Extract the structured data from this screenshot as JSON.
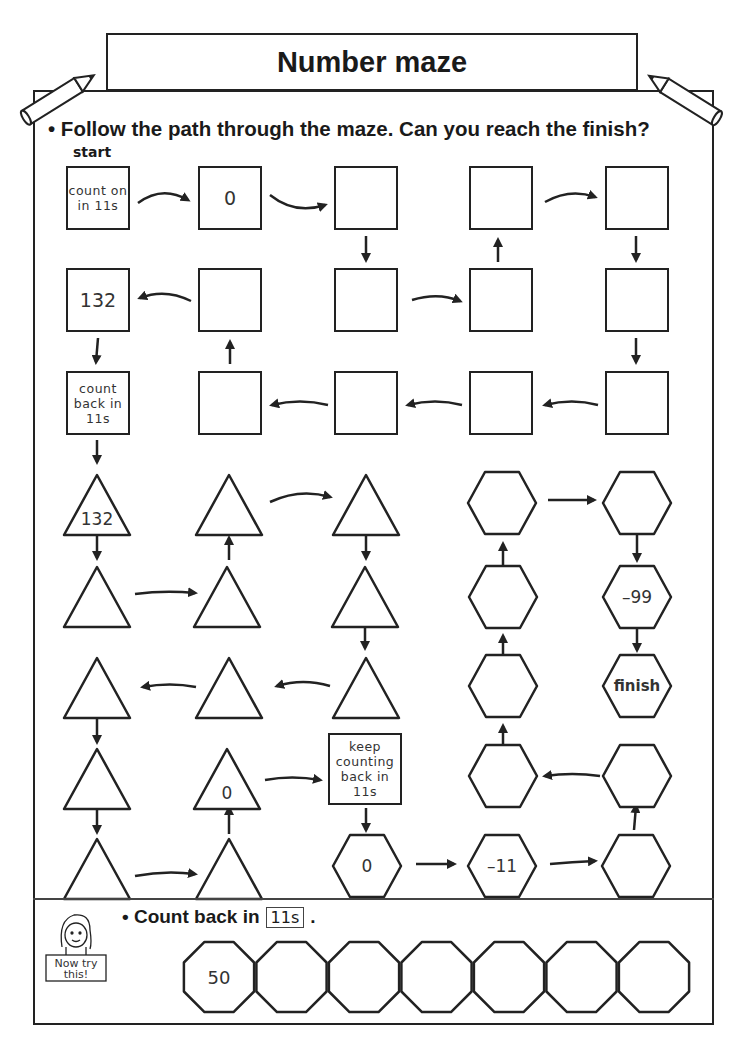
{
  "header": {
    "title": "Number maze"
  },
  "instruction": "• Follow the path through the maze. Can you reach the finish?",
  "start_label": "start",
  "maze": {
    "squares": [
      {
        "id": "s1",
        "x": 66,
        "y": 166,
        "text": "count on in 11s",
        "kind": "note"
      },
      {
        "id": "s2",
        "x": 198,
        "y": 166,
        "text": "0",
        "kind": "val"
      },
      {
        "id": "s3",
        "x": 334,
        "y": 166,
        "text": "",
        "kind": "val"
      },
      {
        "id": "s4",
        "x": 469,
        "y": 166,
        "text": "",
        "kind": "val"
      },
      {
        "id": "s5",
        "x": 605,
        "y": 166,
        "text": "",
        "kind": "val"
      },
      {
        "id": "s6",
        "x": 66,
        "y": 268,
        "text": "132",
        "kind": "val"
      },
      {
        "id": "s7",
        "x": 198,
        "y": 268,
        "text": "",
        "kind": "val"
      },
      {
        "id": "s8",
        "x": 334,
        "y": 268,
        "text": "",
        "kind": "val"
      },
      {
        "id": "s9",
        "x": 469,
        "y": 268,
        "text": "",
        "kind": "val"
      },
      {
        "id": "s10",
        "x": 605,
        "y": 268,
        "text": "",
        "kind": "val"
      },
      {
        "id": "s11",
        "x": 66,
        "y": 371,
        "text": "count back in 11s",
        "kind": "note"
      },
      {
        "id": "s12",
        "x": 198,
        "y": 371,
        "text": "",
        "kind": "val"
      },
      {
        "id": "s13",
        "x": 334,
        "y": 371,
        "text": "",
        "kind": "val"
      },
      {
        "id": "s14",
        "x": 469,
        "y": 371,
        "text": "",
        "kind": "val"
      },
      {
        "id": "s15",
        "x": 605,
        "y": 371,
        "text": "",
        "kind": "val"
      },
      {
        "id": "s16",
        "x": 328,
        "y": 733,
        "text": "keep counting back in 11s",
        "kind": "note"
      }
    ],
    "triangles": [
      {
        "x": 97,
        "y": 505,
        "text": "132"
      },
      {
        "x": 229,
        "y": 505,
        "text": ""
      },
      {
        "x": 366,
        "y": 505,
        "text": ""
      },
      {
        "x": 97,
        "y": 597,
        "text": ""
      },
      {
        "x": 227,
        "y": 597,
        "text": ""
      },
      {
        "x": 365,
        "y": 597,
        "text": ""
      },
      {
        "x": 97,
        "y": 688,
        "text": ""
      },
      {
        "x": 229,
        "y": 688,
        "text": ""
      },
      {
        "x": 366,
        "y": 688,
        "text": ""
      },
      {
        "x": 97,
        "y": 779,
        "text": ""
      },
      {
        "x": 227,
        "y": 779,
        "text": "0"
      },
      {
        "x": 97,
        "y": 869,
        "text": ""
      },
      {
        "x": 229,
        "y": 869,
        "text": ""
      }
    ],
    "hexagons": [
      {
        "x": 502,
        "y": 503,
        "text": ""
      },
      {
        "x": 637,
        "y": 503,
        "text": ""
      },
      {
        "x": 503,
        "y": 597,
        "text": ""
      },
      {
        "x": 637,
        "y": 597,
        "text": "–99"
      },
      {
        "x": 503,
        "y": 686,
        "text": ""
      },
      {
        "x": 637,
        "y": 686,
        "text": "finish"
      },
      {
        "x": 503,
        "y": 776,
        "text": ""
      },
      {
        "x": 637,
        "y": 776,
        "text": ""
      },
      {
        "x": 367,
        "y": 866,
        "text": "0"
      },
      {
        "x": 502,
        "y": 866,
        "text": "–11"
      },
      {
        "x": 636,
        "y": 866,
        "text": ""
      }
    ]
  },
  "now_try_this": {
    "badge_text": "Now try this!",
    "instruction": "• Count back in",
    "step_box": "11s",
    "instruction_end": ".",
    "octagons": [
      "50",
      "",
      "",
      "",
      "",
      "",
      ""
    ]
  }
}
